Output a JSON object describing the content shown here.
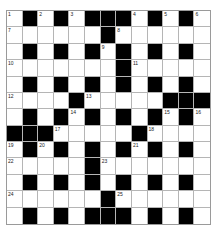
{
  "crossword": {
    "rows": 13,
    "cols": 13,
    "colors": {
      "black": "#000000",
      "white": "#ffffff",
      "line": "#b5b5b5"
    },
    "layout": [
      "W.W.W...W.W.W",
      "WWWWWW.WWWWWW",
      "W.W.W.W.W.W.W",
      "WWWWWWW.WWWWW",
      "W.W.W.W.W.W.W",
      "WWWW.WWWWW...",
      "W.W.W.W.W.W.W",
      "...WWWWW.WWWW",
      "W.W.W.W.W.W.W",
      "WWWWW.WWWWWWW",
      "W.W.W.W.W.W.W",
      "WWWWWW.WWWWWW",
      "W.W.W...W.W.W"
    ],
    "numbers": [
      {
        "r": 0,
        "c": 0,
        "n": "1"
      },
      {
        "r": 0,
        "c": 2,
        "n": "2"
      },
      {
        "r": 0,
        "c": 4,
        "n": "3"
      },
      {
        "r": 0,
        "c": 8,
        "n": "4"
      },
      {
        "r": 0,
        "c": 10,
        "n": "5"
      },
      {
        "r": 0,
        "c": 12,
        "n": "6"
      },
      {
        "r": 1,
        "c": 0,
        "n": "7"
      },
      {
        "r": 1,
        "c": 7,
        "n": "8"
      },
      {
        "r": 2,
        "c": 6,
        "n": "9"
      },
      {
        "r": 3,
        "c": 0,
        "n": "10"
      },
      {
        "r": 3,
        "c": 8,
        "n": "11"
      },
      {
        "r": 5,
        "c": 0,
        "n": "12"
      },
      {
        "r": 5,
        "c": 5,
        "n": "13"
      },
      {
        "r": 6,
        "c": 4,
        "n": "14"
      },
      {
        "r": 6,
        "c": 10,
        "n": "15"
      },
      {
        "r": 6,
        "c": 12,
        "n": "16"
      },
      {
        "r": 7,
        "c": 3,
        "n": "17"
      },
      {
        "r": 7,
        "c": 9,
        "n": "18"
      },
      {
        "r": 8,
        "c": 0,
        "n": "19"
      },
      {
        "r": 8,
        "c": 2,
        "n": "20"
      },
      {
        "r": 8,
        "c": 8,
        "n": "21"
      },
      {
        "r": 9,
        "c": 0,
        "n": "22"
      },
      {
        "r": 9,
        "c": 6,
        "n": "23"
      },
      {
        "r": 11,
        "c": 0,
        "n": "24"
      },
      {
        "r": 11,
        "c": 7,
        "n": "25"
      }
    ]
  }
}
